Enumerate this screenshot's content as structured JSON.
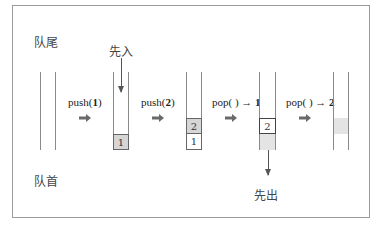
{
  "labels": {
    "queue_tail": "队尾",
    "queue_head": "队首",
    "first_in": "先入",
    "first_out": "先出"
  },
  "operations": [
    {
      "name": "push(",
      "arg": "1",
      "suffix": ")"
    },
    {
      "name": "push(",
      "arg": "2",
      "suffix": ")"
    },
    {
      "name": "pop( ) → ",
      "arg": "1",
      "suffix": ""
    },
    {
      "name": "pop( ) → ",
      "arg": "2",
      "suffix": ""
    }
  ],
  "states": [
    {
      "cells": []
    },
    {
      "cells": [
        {
          "value": "1",
          "style": "gray"
        }
      ]
    },
    {
      "cells": [
        {
          "value": "2",
          "style": "gray"
        },
        {
          "value": "1",
          "style": "white"
        }
      ]
    },
    {
      "cells": [
        {
          "value": "2",
          "style": "white-bold"
        },
        {
          "value": "",
          "style": "faint"
        }
      ]
    },
    {
      "cells": [
        {
          "value": "",
          "style": "faint"
        }
      ]
    }
  ],
  "colors": {
    "cell_gray": "#d6d6d6",
    "cell_faint": "#e4e4e4",
    "arrow": "#6a6a6a",
    "border": "#9a9a9a"
  }
}
